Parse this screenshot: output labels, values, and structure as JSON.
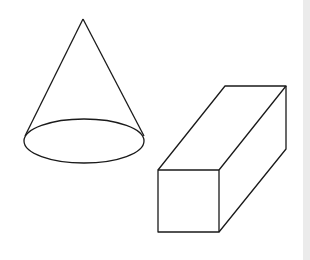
{
  "diagram": {
    "title": "",
    "shapes": [
      {
        "id": "cone",
        "kind": "cone",
        "label": ""
      },
      {
        "id": "cuboid",
        "kind": "rectangular-prism",
        "label": ""
      }
    ]
  },
  "colors": {
    "background": "#ffffff",
    "stroke": "#1a1a1a",
    "side_strip": "#ebebeb"
  }
}
